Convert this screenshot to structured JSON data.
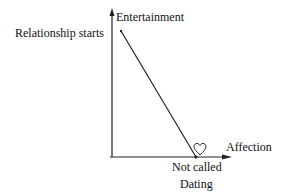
{
  "diagram": {
    "y_axis_label": "Entertainment",
    "x_axis_label": "Affection",
    "start_label": "Relationship starts",
    "end_label_line1": "Not called",
    "end_label_line2": "Dating",
    "end_marker_icon": "heart-outline-icon",
    "colors": {
      "ink": "#111111",
      "background": "#ffffff"
    }
  }
}
